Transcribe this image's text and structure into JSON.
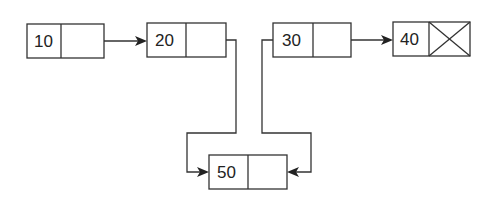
{
  "diagram": {
    "type": "linked-list",
    "stroke_color": "#333333",
    "nodes": [
      {
        "id": "n10",
        "value": "10",
        "next": "n20",
        "null_pointer": false
      },
      {
        "id": "n20",
        "value": "20",
        "next": "n50",
        "null_pointer": false
      },
      {
        "id": "n30",
        "value": "30",
        "next": "n40",
        "null_pointer": false
      },
      {
        "id": "n40",
        "value": "40",
        "next": null,
        "null_pointer": true
      },
      {
        "id": "n50",
        "value": "50",
        "next": "n30",
        "null_pointer": false
      }
    ],
    "edges": [
      {
        "from": "10",
        "to": "20"
      },
      {
        "from": "20",
        "to": "50"
      },
      {
        "from": "30",
        "to": "40"
      },
      {
        "from": "30-back",
        "to": "50"
      }
    ]
  }
}
